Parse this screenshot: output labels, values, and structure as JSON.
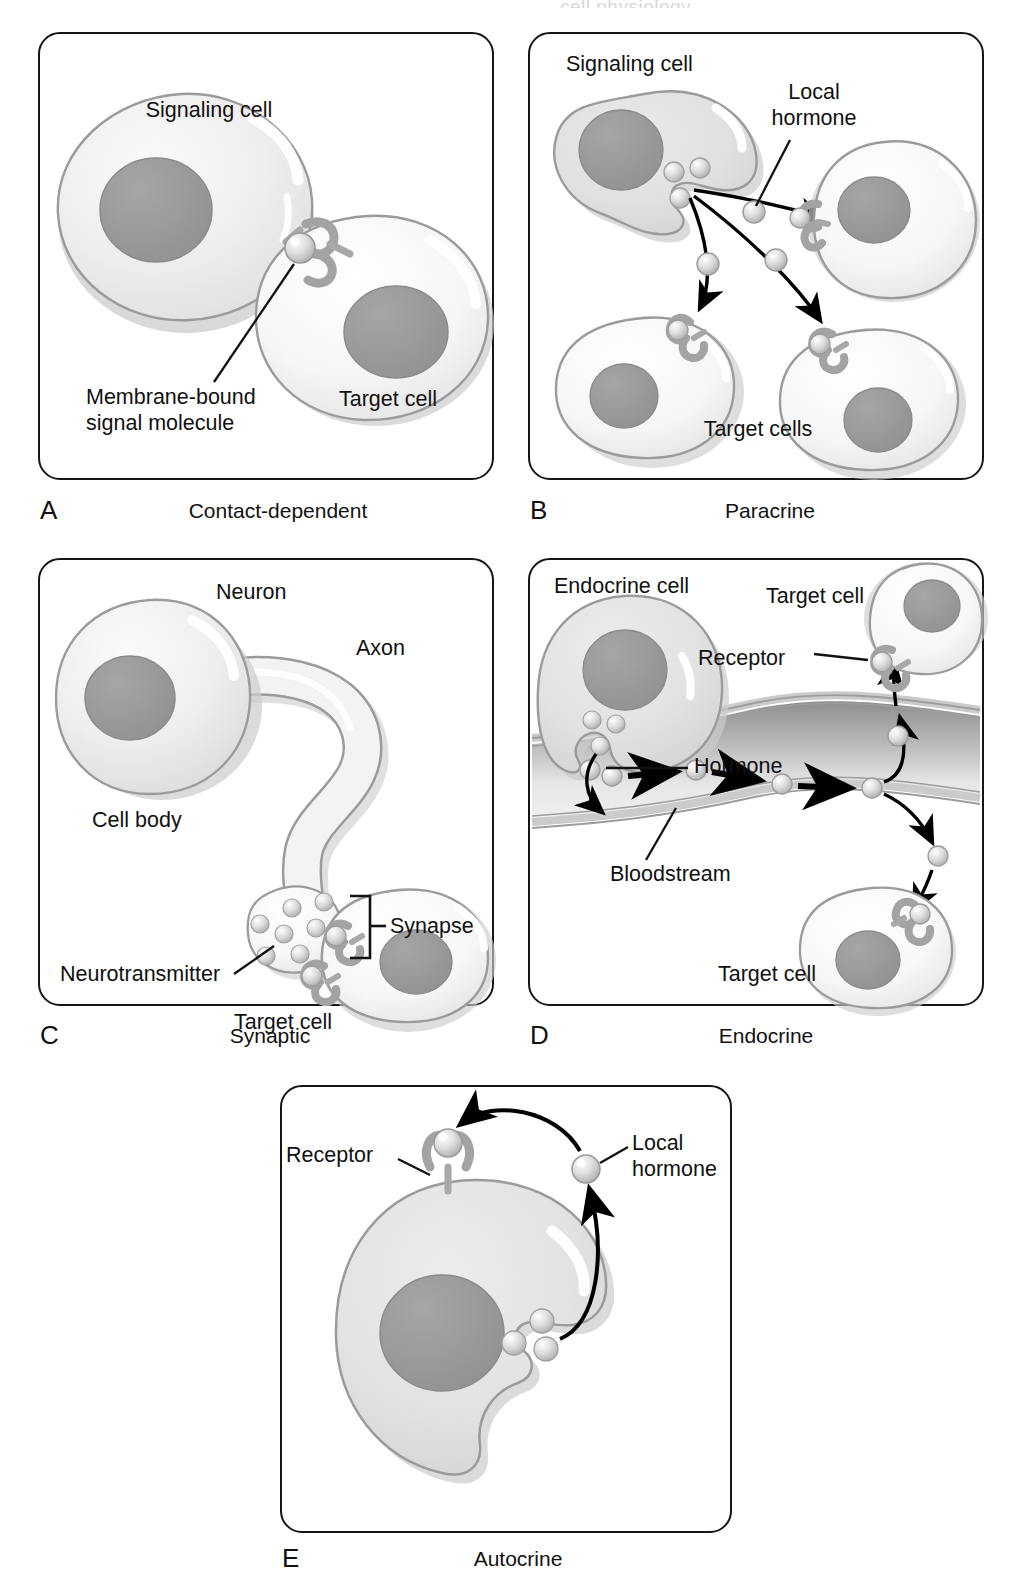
{
  "figure": {
    "title_fragment": "cell physiology",
    "background": "#ffffff"
  },
  "palette": {
    "outline": "#151515",
    "cell_outline": "#9b9b9b",
    "cell_fill_light": "#f2f2f2",
    "cell_fill_mid": "#e3e3e3",
    "cell_fill_dark": "#d6d6d6",
    "nucleus": "#9a9a9a",
    "nucleus_outline": "#8a8a8a",
    "highlight": "#ffffff",
    "shadow": "#c9c9c9",
    "vesicle": "#d9d9d9",
    "vessel_wall": "#cfcfcf",
    "vessel_lumen_dark": "#9f9f9f",
    "vessel_lumen_light": "#e8e8e8",
    "arrow": "#000000",
    "leader": "#111111"
  },
  "panels": [
    {
      "id": "A",
      "letter": "A",
      "title": "Contact-dependent",
      "labels": {
        "signaling_cell": "Signaling cell",
        "target_cell": "Target cell",
        "signal_molecule_line1": "Membrane-bound",
        "signal_molecule_line2": "signal molecule"
      },
      "icons": [
        "signaling-cell",
        "target-cell",
        "membrane-bound-signal-molecule",
        "receptor"
      ]
    },
    {
      "id": "B",
      "letter": "B",
      "title": "Paracrine",
      "labels": {
        "signaling_cell": "Signaling cell",
        "local_hormone_line1": "Local",
        "local_hormone_line2": "hormone",
        "target_cells": "Target cells"
      },
      "target_cell_count": 3,
      "hormone_arrow_count": 3,
      "vesicle_count": 3,
      "icons": [
        "signaling-cell",
        "secretion-pocket",
        "local-hormone",
        "receptor",
        "target-cell"
      ]
    },
    {
      "id": "C",
      "letter": "C",
      "title": "Synaptic",
      "labels": {
        "neuron": "Neuron",
        "axon": "Axon",
        "cell_body": "Cell body",
        "neurotransmitter": "Neurotransmitter",
        "synapse": "Synapse",
        "target_cell": "Target cell"
      },
      "neurotransmitter_count": 9,
      "receptor_count": 2,
      "icons": [
        "neuron",
        "axon",
        "synaptic-terminal",
        "neurotransmitter",
        "synapse-bracket",
        "target-cell",
        "receptor"
      ]
    },
    {
      "id": "D",
      "letter": "D",
      "title": "Endocrine",
      "labels": {
        "endocrine_cell": "Endocrine cell",
        "target_cell_top": "Target cell",
        "target_cell_bottom": "Target cell",
        "receptor": "Receptor",
        "hormone": "Hormone",
        "bloodstream": "Bloodstream"
      },
      "hormones_in_vessel": 4,
      "flow_arrow_count": 4,
      "vesicle_count": 3,
      "icons": [
        "endocrine-cell",
        "secretion-pocket",
        "hormone",
        "bloodstream-vessel",
        "receptor",
        "target-cell"
      ]
    },
    {
      "id": "E",
      "letter": "E",
      "title": "Autocrine",
      "labels": {
        "receptor": "Receptor",
        "local_hormone_line1": "Local",
        "local_hormone_line2": "hormone"
      },
      "vesicle_count": 3,
      "icons": [
        "autocrine-cell",
        "receptor",
        "local-hormone",
        "secretion-pocket",
        "feedback-arrow"
      ]
    }
  ]
}
